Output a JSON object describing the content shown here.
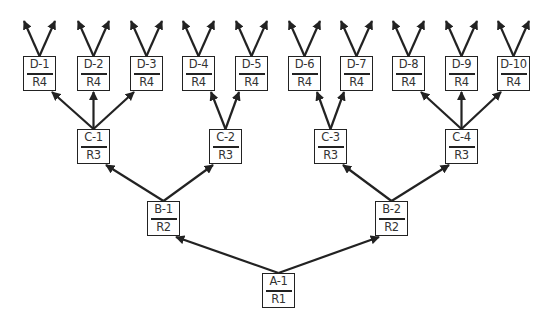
{
  "diagram": {
    "type": "tree",
    "direction": "bottom-up",
    "line_color": "#222222",
    "nodes": [
      {
        "id": "A-1",
        "label": "A-1",
        "sublabel": "R1",
        "x": 262,
        "y": 273
      },
      {
        "id": "B-1",
        "label": "B-1",
        "sublabel": "R2",
        "x": 147,
        "y": 201
      },
      {
        "id": "B-2",
        "label": "B-2",
        "sublabel": "R2",
        "x": 375,
        "y": 201
      },
      {
        "id": "C-1",
        "label": "C-1",
        "sublabel": "R3",
        "x": 77,
        "y": 129
      },
      {
        "id": "C-2",
        "label": "C-2",
        "sublabel": "R3",
        "x": 209,
        "y": 129
      },
      {
        "id": "C-3",
        "label": "C-3",
        "sublabel": "R3",
        "x": 314,
        "y": 129
      },
      {
        "id": "C-4",
        "label": "C-4",
        "sublabel": "R3",
        "x": 445,
        "y": 129
      },
      {
        "id": "D-1",
        "label": "D-1",
        "sublabel": "R4",
        "x": 23,
        "y": 56
      },
      {
        "id": "D-2",
        "label": "D-2",
        "sublabel": "R4",
        "x": 77,
        "y": 56
      },
      {
        "id": "D-3",
        "label": "D-3",
        "sublabel": "R4",
        "x": 130,
        "y": 56
      },
      {
        "id": "D-4",
        "label": "D-4",
        "sublabel": "R4",
        "x": 182,
        "y": 56
      },
      {
        "id": "D-5",
        "label": "D-5",
        "sublabel": "R4",
        "x": 235,
        "y": 56
      },
      {
        "id": "D-6",
        "label": "D-6",
        "sublabel": "R4",
        "x": 288,
        "y": 56
      },
      {
        "id": "D-7",
        "label": "D-7",
        "sublabel": "R4",
        "x": 340,
        "y": 56
      },
      {
        "id": "D-8",
        "label": "D-8",
        "sublabel": "R4",
        "x": 392,
        "y": 56
      },
      {
        "id": "D-9",
        "label": "D-9",
        "sublabel": "R4",
        "x": 445,
        "y": 56
      },
      {
        "id": "D-10",
        "label": "D-10",
        "sublabel": "R4",
        "x": 497,
        "y": 56
      }
    ],
    "edges": [
      {
        "from": "A-1",
        "to": "B-1"
      },
      {
        "from": "A-1",
        "to": "B-2"
      },
      {
        "from": "B-1",
        "to": "C-1"
      },
      {
        "from": "B-1",
        "to": "C-2"
      },
      {
        "from": "B-2",
        "to": "C-3"
      },
      {
        "from": "B-2",
        "to": "C-4"
      },
      {
        "from": "C-1",
        "to": "D-1"
      },
      {
        "from": "C-1",
        "to": "D-2"
      },
      {
        "from": "C-1",
        "to": "D-3"
      },
      {
        "from": "C-2",
        "to": "D-4"
      },
      {
        "from": "C-2",
        "to": "D-5"
      },
      {
        "from": "C-3",
        "to": "D-6"
      },
      {
        "from": "C-3",
        "to": "D-7"
      },
      {
        "from": "C-4",
        "to": "D-8"
      },
      {
        "from": "C-4",
        "to": "D-9"
      },
      {
        "from": "C-4",
        "to": "D-10"
      }
    ],
    "open_arrows_per_leaf": 2
  }
}
